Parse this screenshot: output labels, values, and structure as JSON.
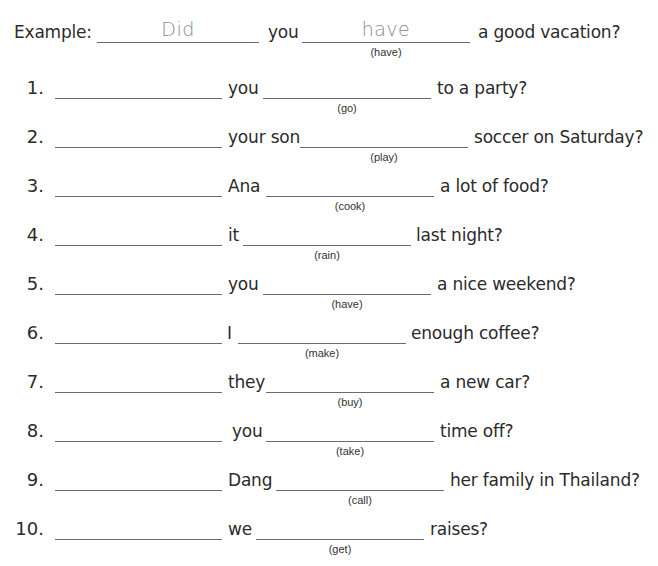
{
  "example": {
    "label": "Example:",
    "answer1": "Did",
    "subject": "you",
    "answer2": "have",
    "hint": "(have)",
    "ending": "a good vacation?"
  },
  "items": [
    {
      "number": "1.",
      "subject": "you",
      "hint": "(go)",
      "ending": "to a party?"
    },
    {
      "number": "2.",
      "subject": "your son",
      "hint": "(play)",
      "ending": "soccer on Saturday?"
    },
    {
      "number": "3.",
      "subject": "Ana",
      "hint": "(cook)",
      "ending": "a lot of food?"
    },
    {
      "number": "4.",
      "subject": "it",
      "hint": "(rain)",
      "ending": "last night?"
    },
    {
      "number": "5.",
      "subject": "you",
      "hint": "(have)",
      "ending": "a nice weekend?"
    },
    {
      "number": "6.",
      "subject": "I",
      "hint": "(make)",
      "ending": "enough coffee?"
    },
    {
      "number": "7.",
      "subject": "they",
      "hint": "(buy)",
      "ending": "a new car?"
    },
    {
      "number": "8.",
      "subject": "you",
      "hint": "(take)",
      "ending": "time off?"
    },
    {
      "number": "9.",
      "subject": "Dang",
      "hint": "(call)",
      "ending": "her family in Thailand?"
    },
    {
      "number": "10.",
      "subject": "we",
      "hint": "(get)",
      "ending": "raises?"
    }
  ]
}
